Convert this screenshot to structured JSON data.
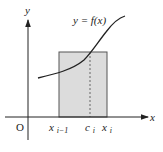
{
  "diagram": {
    "type": "riemann-sum-rectangle",
    "axes": {
      "x_label": "x",
      "y_label": "y",
      "origin_label": "O"
    },
    "curve": {
      "label": "y = f(x)",
      "color": "#222222"
    },
    "rectangle": {
      "fill": "#dcdcdc",
      "stroke": "#555555",
      "left_label_base": "x",
      "left_label_sub": "i−1",
      "right_label_base": "x",
      "right_label_sub": "i"
    },
    "sample_point": {
      "label_base": "c",
      "label_sub": "i",
      "line_style": "dashed"
    }
  }
}
